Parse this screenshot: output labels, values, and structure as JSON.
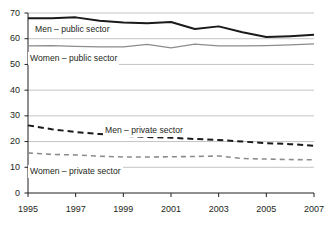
{
  "chart_data": {
    "type": "line",
    "title": "",
    "subtitle": "",
    "xlabel": "",
    "ylabel": "",
    "x": [
      1995,
      1996,
      1997,
      1998,
      1999,
      2000,
      2001,
      2002,
      2003,
      2004,
      2005,
      2006,
      2007
    ],
    "xlim": [
      1995,
      2007
    ],
    "ylim": [
      0,
      70
    ],
    "y_ticks": [
      0,
      10,
      20,
      30,
      40,
      50,
      60,
      70
    ],
    "x_ticks": [
      1995,
      1997,
      1999,
      2001,
      2003,
      2005,
      2007
    ],
    "x_tick_labels": [
      "1995",
      "1997",
      "1999",
      "2001",
      "2003",
      "2005",
      "2007"
    ],
    "y_tick_labels": [
      "0",
      "10",
      "20",
      "30",
      "40",
      "50",
      "60",
      "70"
    ],
    "grid": true,
    "grid_axis": "y",
    "legend": "inline-labels",
    "series": [
      {
        "name": "Men – public sector",
        "color": "#1a1a1a",
        "style": "solid",
        "width": 2.0,
        "label_x": 33,
        "label_y": 23,
        "values": [
          68.0,
          68.0,
          68.3,
          67.0,
          66.3,
          66.0,
          66.5,
          63.8,
          64.8,
          62.5,
          60.7,
          61.0,
          61.5
        ]
      },
      {
        "name": "Women – public sector",
        "color": "#8c8c8c",
        "style": "solid",
        "width": 1.3,
        "label_x": 28,
        "label_y": 52,
        "values": [
          57.2,
          57.3,
          57.0,
          56.8,
          56.8,
          57.8,
          56.4,
          57.9,
          57.2,
          57.2,
          57.3,
          57.6,
          58.0
        ]
      },
      {
        "name": "Men – private sector",
        "color": "#1a1a1a",
        "style": "dashed",
        "width": 2.0,
        "label_x": 103,
        "label_y": 124,
        "values": [
          26.3,
          24.8,
          23.7,
          22.9,
          22.3,
          21.8,
          21.5,
          21.0,
          20.6,
          20.0,
          19.4,
          19.0,
          18.4
        ]
      },
      {
        "name": "Women – private sector",
        "color": "#8c8c8c",
        "style": "dashed",
        "width": 1.6,
        "label_x": 28,
        "label_y": 165,
        "values": [
          15.6,
          15.0,
          14.8,
          14.3,
          14.0,
          14.0,
          14.1,
          14.2,
          14.4,
          13.4,
          13.2,
          13.0,
          12.9
        ]
      }
    ],
    "colors": {
      "axis": "#231f20",
      "grid": "#a7a9ac",
      "background": "#ffffff",
      "dark_series": "#1a1a1a",
      "light_series": "#8c8c8c"
    }
  }
}
